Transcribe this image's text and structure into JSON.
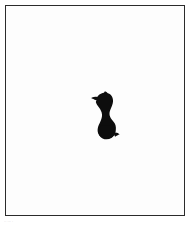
{
  "page": {
    "background_color": "#ffffff",
    "width": 192,
    "height": 228
  },
  "frame": {
    "border_color": "#2b2b2b",
    "fill_color": "#fdfdfd",
    "name": "ruled-rectangular-border"
  },
  "artwork": {
    "title": "",
    "subject": "animal-silhouette",
    "description": "Solid black silhouette of a small animal with a raised head facing left, curved neck and rounded body",
    "fill_color": "#0d0d0d",
    "position": "center",
    "icon_name": "animal-silhouette-icon"
  },
  "plate_mark": {
    "text": "·· ··· ·",
    "color": "#9a9a9a"
  }
}
